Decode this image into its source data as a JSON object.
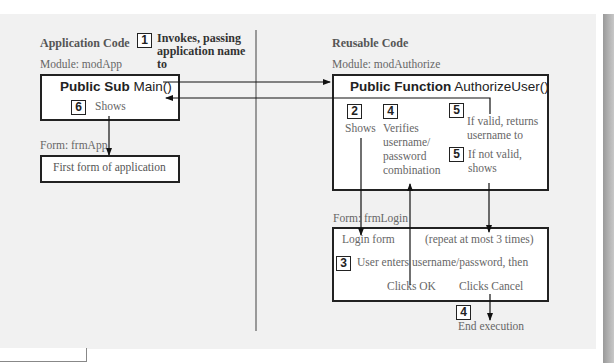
{
  "left": {
    "section_title": "Application Code",
    "module_label": "Module: modApp",
    "main_box": {
      "keyword": "Public Sub",
      "name": "Main()"
    },
    "step1": {
      "number": "1",
      "text": "Invokes, passing application name to"
    },
    "step6": {
      "number": "6",
      "text": "Shows"
    },
    "form_label": "Form: frmApp",
    "form_box_text": "First form of application"
  },
  "right": {
    "section_title": "Reusable Code",
    "module_label": "Module: modAuthorize",
    "function_box": {
      "keyword": "Public Function",
      "name": "AuthorizeUser()"
    },
    "step2": {
      "number": "2",
      "text": "Shows"
    },
    "step4a": {
      "number": "4",
      "text": "Verifies username/ password combination"
    },
    "step5a": {
      "number": "5",
      "text": "If valid, returns username to"
    },
    "step5b": {
      "number": "5",
      "text": "If not valid, shows"
    },
    "form_label": "Form: frmLogin",
    "login_box": {
      "title": "Login form",
      "repeat_note": "(repeat at most 3 times)",
      "step3": {
        "number": "3",
        "text": "User enters username/password, then"
      },
      "clicks_ok": "Clicks OK",
      "clicks_cancel": "Clicks Cancel"
    },
    "step4b": {
      "number": "4",
      "text": "End execution"
    }
  }
}
